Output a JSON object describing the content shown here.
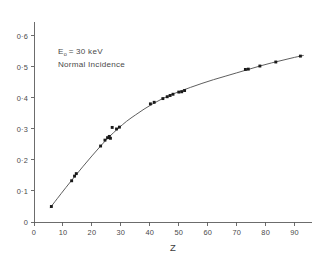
{
  "chart_data": {
    "type": "scatter",
    "title": "",
    "subtitle": "",
    "xlabel": "Z",
    "ylabel": "",
    "xlim": [
      0,
      96
    ],
    "ylim": [
      0,
      0.645
    ],
    "grid": false,
    "legend": null,
    "annotations": [
      {
        "id": "beam-energy",
        "text_main": "E",
        "text_sub": "o",
        "text_rest": "= 30 keV"
      },
      {
        "id": "incidence",
        "text": "Normal Incidence"
      }
    ],
    "xticks": [
      0,
      10,
      20,
      30,
      40,
      50,
      60,
      70,
      80,
      90
    ],
    "xtick_labels": [
      "0",
      "10",
      "20",
      "30",
      "40",
      "50",
      "60",
      "70",
      "80",
      "90"
    ],
    "yticks": [
      0,
      0.1,
      0.2,
      0.3,
      0.4,
      0.5,
      0.6
    ],
    "ytick_labels": [
      "0",
      "0·1",
      "0·2",
      "0·3",
      "0·4",
      "0·5",
      "0·6"
    ],
    "series": [
      {
        "name": "measured",
        "marker": "square",
        "marker_color": "#1a1a1a",
        "points": [
          [
            6,
            0.05
          ],
          [
            13,
            0.133
          ],
          [
            14,
            0.148
          ],
          [
            14.6,
            0.156
          ],
          [
            23,
            0.245
          ],
          [
            24.5,
            0.264
          ],
          [
            25.4,
            0.272
          ],
          [
            26,
            0.276
          ],
          [
            26.4,
            0.27
          ],
          [
            27,
            0.305
          ],
          [
            28.5,
            0.3
          ],
          [
            29.5,
            0.306
          ],
          [
            40.2,
            0.381
          ],
          [
            41.5,
            0.386
          ],
          [
            44.5,
            0.398
          ],
          [
            46,
            0.404
          ],
          [
            47,
            0.408
          ],
          [
            48,
            0.412
          ],
          [
            50,
            0.419
          ],
          [
            51,
            0.42
          ],
          [
            52,
            0.424
          ],
          [
            73,
            0.492
          ],
          [
            74,
            0.493
          ],
          [
            78,
            0.503
          ],
          [
            83.5,
            0.516
          ],
          [
            92,
            0.535
          ]
        ]
      },
      {
        "name": "fitted-curve",
        "marker": "none",
        "line_color": "#555555",
        "points": [
          [
            5.6,
            0.046
          ],
          [
            8,
            0.075
          ],
          [
            11,
            0.111
          ],
          [
            14,
            0.146
          ],
          [
            17,
            0.18
          ],
          [
            20,
            0.213
          ],
          [
            23,
            0.245
          ],
          [
            26,
            0.275
          ],
          [
            29,
            0.301
          ],
          [
            32,
            0.325
          ],
          [
            35,
            0.345
          ],
          [
            38,
            0.364
          ],
          [
            41,
            0.381
          ],
          [
            44,
            0.396
          ],
          [
            47,
            0.409
          ],
          [
            50,
            0.42
          ],
          [
            54,
            0.434
          ],
          [
            58,
            0.447
          ],
          [
            62,
            0.459
          ],
          [
            66,
            0.47
          ],
          [
            70,
            0.481
          ],
          [
            74,
            0.492
          ],
          [
            78,
            0.503
          ],
          [
            82,
            0.513
          ],
          [
            86,
            0.522
          ],
          [
            90,
            0.531
          ],
          [
            93,
            0.537
          ]
        ]
      }
    ]
  }
}
